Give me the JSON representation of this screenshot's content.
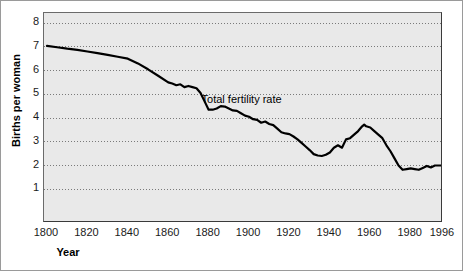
{
  "chart_data": {
    "type": "line",
    "title": "",
    "xlabel": "Year",
    "ylabel": "Births per woman",
    "xlim": [
      1800,
      1996
    ],
    "ylim": [
      0,
      8
    ],
    "grid": true,
    "grid_style": "dotted-horizontal",
    "legend": "none",
    "annotations": [
      {
        "text": "Total fertility rate",
        "x": 1877,
        "y": 4.72
      }
    ],
    "xticks": [
      1800,
      1820,
      1840,
      1860,
      1880,
      1900,
      1920,
      1940,
      1960,
      1980,
      1996
    ],
    "xtick_labels": [
      "1800",
      "1820",
      "1840",
      "1860",
      "1880",
      "1900",
      "1920",
      "1940",
      "1960",
      "1980",
      "1996"
    ],
    "yticks": [
      1,
      2,
      3,
      4,
      5,
      6,
      7,
      8
    ],
    "ytick_labels": [
      "1",
      "2",
      "3",
      "4",
      "5",
      "6",
      "7",
      "8"
    ],
    "series": [
      {
        "name": "Total fertility rate",
        "color": "#000000",
        "linewidth": 2.2,
        "x": [
          1800,
          1805,
          1810,
          1815,
          1820,
          1825,
          1830,
          1835,
          1840,
          1845,
          1850,
          1855,
          1860,
          1862,
          1864,
          1866,
          1868,
          1870,
          1872,
          1874,
          1876,
          1878,
          1880,
          1882,
          1884,
          1886,
          1888,
          1890,
          1892,
          1894,
          1896,
          1898,
          1900,
          1902,
          1904,
          1906,
          1908,
          1910,
          1912,
          1914,
          1916,
          1918,
          1920,
          1922,
          1924,
          1926,
          1928,
          1930,
          1932,
          1934,
          1936,
          1938,
          1940,
          1942,
          1944,
          1946,
          1948,
          1950,
          1952,
          1954,
          1956,
          1957,
          1958,
          1960,
          1962,
          1964,
          1966,
          1968,
          1970,
          1972,
          1974,
          1976,
          1978,
          1980,
          1982,
          1984,
          1986,
          1988,
          1990,
          1992,
          1994,
          1996
        ],
        "y": [
          7.04,
          6.98,
          6.92,
          6.87,
          6.8,
          6.73,
          6.66,
          6.58,
          6.5,
          6.3,
          6.05,
          5.78,
          5.5,
          5.45,
          5.38,
          5.42,
          5.3,
          5.35,
          5.3,
          5.25,
          5.05,
          4.7,
          4.35,
          4.35,
          4.4,
          4.5,
          4.48,
          4.4,
          4.32,
          4.3,
          4.2,
          4.1,
          4.05,
          3.95,
          3.92,
          3.8,
          3.85,
          3.75,
          3.7,
          3.55,
          3.4,
          3.35,
          3.32,
          3.22,
          3.1,
          2.95,
          2.8,
          2.65,
          2.48,
          2.42,
          2.4,
          2.45,
          2.55,
          2.75,
          2.85,
          2.75,
          3.1,
          3.15,
          3.3,
          3.45,
          3.65,
          3.72,
          3.65,
          3.6,
          3.45,
          3.3,
          3.15,
          2.85,
          2.6,
          2.3,
          2.0,
          1.82,
          1.85,
          1.88,
          1.85,
          1.82,
          1.9,
          1.98,
          1.92,
          2.0,
          2.0,
          2.0
        ]
      }
    ]
  },
  "axes": {
    "y_title": "Births per woman",
    "x_title": "Year"
  },
  "colors": {
    "plot_background": "#e9e9e9",
    "page_background": "#ffffff",
    "line": "#000000",
    "grid": "#7a7a7a",
    "axis": "#3a3a3a",
    "text": "#1a1a1a"
  }
}
